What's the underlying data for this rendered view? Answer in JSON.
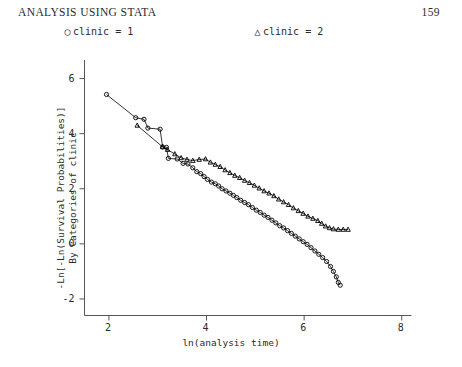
{
  "header": {
    "title": "ANALYSIS USING STATA",
    "page_number": "159"
  },
  "legend": {
    "position": "above-plot",
    "items": [
      {
        "marker": "circle-marker",
        "glyph": "○",
        "label": "clinic = 1"
      },
      {
        "marker": "triangle-marker",
        "glyph": "△",
        "label": "clinic = 2"
      }
    ]
  },
  "chart_data": {
    "type": "line",
    "title": "",
    "subtitle": "",
    "xlabel": "ln(analysis time)",
    "ylabel_line1": "-Ln[-Ln(Survival Probabilities)]",
    "ylabel_line2": "By Categories of clinic",
    "xlim": [
      1.5,
      8.2
    ],
    "ylim": [
      -2.6,
      6.6
    ],
    "xticks": [
      2,
      4,
      6,
      8
    ],
    "xticklabels": [
      "2",
      "4",
      "6",
      "8"
    ],
    "yticks": [
      -2,
      0,
      2,
      4,
      6
    ],
    "yticklabels": [
      "-2",
      "0",
      "2",
      "4",
      "6"
    ],
    "grid": false,
    "legend_position": "top",
    "colors": {
      "line": "#000000",
      "axis": "#555555",
      "text": "#2b2b2b",
      "background": "#ffffff"
    },
    "series": [
      {
        "name": "clinic = 1",
        "marker": "circle",
        "points": [
          [
            1.95,
            5.42
          ],
          [
            2.55,
            4.58
          ],
          [
            2.72,
            4.52
          ],
          [
            2.8,
            4.2
          ],
          [
            3.05,
            4.16
          ],
          [
            3.1,
            3.52
          ],
          [
            3.18,
            3.5
          ],
          [
            3.22,
            3.1
          ],
          [
            3.4,
            3.08
          ],
          [
            3.52,
            2.92
          ],
          [
            3.62,
            2.9
          ],
          [
            3.72,
            2.76
          ],
          [
            3.8,
            2.62
          ],
          [
            3.88,
            2.55
          ],
          [
            3.95,
            2.44
          ],
          [
            4.02,
            2.34
          ],
          [
            4.1,
            2.24
          ],
          [
            4.18,
            2.18
          ],
          [
            4.25,
            2.1
          ],
          [
            4.32,
            2.0
          ],
          [
            4.4,
            1.92
          ],
          [
            4.48,
            1.84
          ],
          [
            4.55,
            1.76
          ],
          [
            4.62,
            1.68
          ],
          [
            4.7,
            1.58
          ],
          [
            4.78,
            1.5
          ],
          [
            4.86,
            1.42
          ],
          [
            4.94,
            1.32
          ],
          [
            5.02,
            1.22
          ],
          [
            5.1,
            1.14
          ],
          [
            5.18,
            1.04
          ],
          [
            5.26,
            0.96
          ],
          [
            5.34,
            0.86
          ],
          [
            5.42,
            0.76
          ],
          [
            5.5,
            0.66
          ],
          [
            5.58,
            0.58
          ],
          [
            5.66,
            0.48
          ],
          [
            5.74,
            0.38
          ],
          [
            5.82,
            0.28
          ],
          [
            5.9,
            0.18
          ],
          [
            5.98,
            0.08
          ],
          [
            6.06,
            -0.02
          ],
          [
            6.14,
            -0.14
          ],
          [
            6.22,
            -0.26
          ],
          [
            6.3,
            -0.38
          ],
          [
            6.38,
            -0.5
          ],
          [
            6.46,
            -0.64
          ],
          [
            6.54,
            -0.82
          ],
          [
            6.6,
            -1.0
          ],
          [
            6.66,
            -1.2
          ],
          [
            6.7,
            -1.4
          ],
          [
            6.74,
            -1.5
          ]
        ]
      },
      {
        "name": "clinic = 2",
        "marker": "triangle",
        "points": [
          [
            2.58,
            4.3
          ],
          [
            3.1,
            3.52
          ],
          [
            3.2,
            3.42
          ],
          [
            3.35,
            3.26
          ],
          [
            3.48,
            3.12
          ],
          [
            3.6,
            3.06
          ],
          [
            3.72,
            3.02
          ],
          [
            3.85,
            3.06
          ],
          [
            3.98,
            3.08
          ],
          [
            4.08,
            2.96
          ],
          [
            4.18,
            2.88
          ],
          [
            4.28,
            2.8
          ],
          [
            4.38,
            2.68
          ],
          [
            4.48,
            2.58
          ],
          [
            4.58,
            2.48
          ],
          [
            4.68,
            2.4
          ],
          [
            4.78,
            2.3
          ],
          [
            4.88,
            2.22
          ],
          [
            4.98,
            2.12
          ],
          [
            5.08,
            2.02
          ],
          [
            5.18,
            1.92
          ],
          [
            5.28,
            1.84
          ],
          [
            5.38,
            1.74
          ],
          [
            5.48,
            1.62
          ],
          [
            5.58,
            1.52
          ],
          [
            5.68,
            1.42
          ],
          [
            5.78,
            1.3
          ],
          [
            5.88,
            1.2
          ],
          [
            5.98,
            1.1
          ],
          [
            6.08,
            1.0
          ],
          [
            6.18,
            0.92
          ],
          [
            6.28,
            0.84
          ],
          [
            6.36,
            0.74
          ],
          [
            6.44,
            0.64
          ],
          [
            6.52,
            0.58
          ],
          [
            6.6,
            0.54
          ],
          [
            6.7,
            0.52
          ],
          [
            6.8,
            0.52
          ],
          [
            6.9,
            0.52
          ]
        ]
      }
    ]
  }
}
